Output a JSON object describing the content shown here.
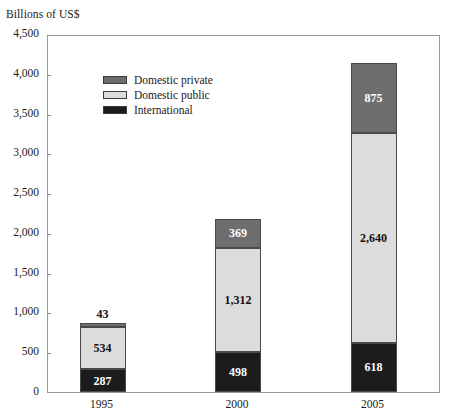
{
  "chart_data": {
    "type": "bar",
    "subtype": "stacked-column",
    "title": "",
    "ylabel": "Billions of US$",
    "xlabel": "",
    "categories": [
      "1995",
      "2000",
      "2005"
    ],
    "series": [
      {
        "name": "International",
        "values": [
          287,
          498,
          618
        ],
        "color": "#1c1c1c",
        "label_color": "#ffffff"
      },
      {
        "name": "Domestic public",
        "values": [
          534,
          1312,
          2640
        ],
        "color": "#dcdcdc",
        "label_color": "#111111"
      },
      {
        "name": "Domestic private",
        "values": [
          43,
          369,
          875
        ],
        "color": "#6e6e6e",
        "label_color": "#ffffff"
      }
    ],
    "value_labels": {
      "1995": [
        "287",
        "534",
        "43"
      ],
      "2000": [
        "498",
        "1,312",
        "369"
      ],
      "2005": [
        "618",
        "2,640",
        "875"
      ]
    },
    "totals": [
      864,
      2179,
      4133
    ],
    "ylim": [
      0,
      4500
    ],
    "ytick_values": [
      0,
      500,
      1000,
      1500,
      2000,
      2500,
      3000,
      3500,
      4000,
      4500
    ],
    "ytick_labels": [
      "0",
      "500",
      "1,000",
      "1,500",
      "2,000",
      "2,500",
      "3,000",
      "3,500",
      "4,000",
      "4,500"
    ],
    "grid": false,
    "legend": {
      "position": "top-left-inside",
      "entries": [
        {
          "label": "Domestic private",
          "color": "#6e6e6e"
        },
        {
          "label": "Domestic public",
          "color": "#dcdcdc"
        },
        {
          "label": "International",
          "color": "#1c1c1c"
        }
      ]
    }
  },
  "axis": {
    "y_title": "Billions of US$"
  }
}
